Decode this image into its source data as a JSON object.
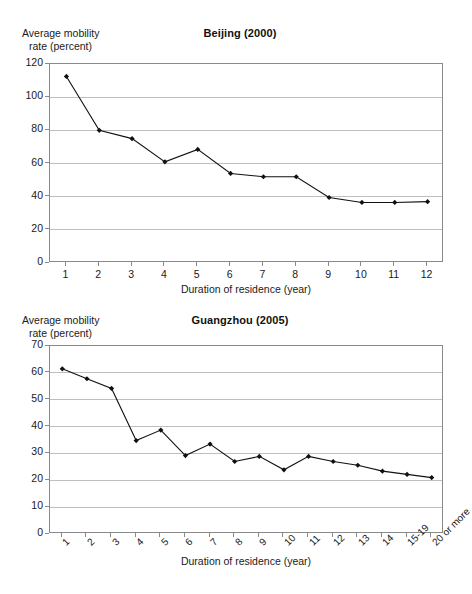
{
  "page": {
    "background": "#ffffff",
    "line_color": "#111111",
    "grid_color": "#bfbfbf",
    "axis_color": "#8a8a8a"
  },
  "charts": [
    {
      "id": "beijing",
      "title": "Beijing (2000)",
      "ylabel_line1": "Average mobility",
      "ylabel_line2": "rate (percent)",
      "xlabel": "Duration of residence (year)",
      "ytick_labels": [
        "0",
        "20",
        "40",
        "60",
        "80",
        "100",
        "120"
      ],
      "xtick_labels": [
        "1",
        "2",
        "3",
        "4",
        "5",
        "6",
        "7",
        "8",
        "9",
        "10",
        "11",
        "12"
      ]
    },
    {
      "id": "guangzhou",
      "title": "Guangzhou (2005)",
      "ylabel_line1": "Average mobility",
      "ylabel_line2": "rate (percent)",
      "xlabel": "Duration of residence (year)",
      "ytick_labels": [
        "0",
        "10",
        "20",
        "30",
        "40",
        "50",
        "60",
        "70"
      ],
      "xtick_labels": [
        "1",
        "2",
        "3",
        "4",
        "5",
        "6",
        "7",
        "8",
        "9",
        "10",
        "11",
        "12",
        "13",
        "14",
        "15-19",
        "20 or more"
      ]
    }
  ],
  "chart_data": [
    {
      "type": "line",
      "title": "Beijing (2000)",
      "xlabel": "Duration of residence (year)",
      "ylabel": "Average mobility rate (percent)",
      "categories": [
        "1",
        "2",
        "3",
        "4",
        "5",
        "6",
        "7",
        "8",
        "9",
        "10",
        "11",
        "12"
      ],
      "values": [
        112.5,
        80.0,
        75.0,
        61.0,
        68.5,
        54.0,
        52.0,
        52.0,
        39.5,
        36.5,
        36.5,
        37.0
      ],
      "ylim": [
        0,
        120
      ],
      "ytick_step": 20,
      "grid": true,
      "legend": "none",
      "marker": "diamond",
      "line_color": "#111111"
    },
    {
      "type": "line",
      "title": "Guangzhou (2005)",
      "xlabel": "Duration of residence (year)",
      "ylabel": "Average mobility rate (percent)",
      "categories": [
        "1",
        "2",
        "3",
        "4",
        "5",
        "6",
        "7",
        "8",
        "9",
        "10",
        "11",
        "12",
        "13",
        "14",
        "15-19",
        "20 or more"
      ],
      "values": [
        61.5,
        57.8,
        54.2,
        34.8,
        38.7,
        29.2,
        33.5,
        27.0,
        28.9,
        23.9,
        28.9,
        27.0,
        25.6,
        23.4,
        22.2,
        21.0
      ],
      "ylim": [
        0,
        70
      ],
      "ytick_step": 10,
      "grid": true,
      "legend": "none",
      "marker": "diamond",
      "line_color": "#111111"
    }
  ]
}
